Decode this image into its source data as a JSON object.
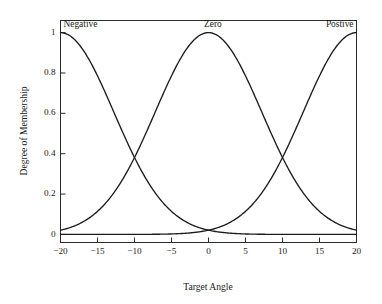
{
  "chart_data": {
    "type": "line",
    "title": "",
    "xlabel": "Target Angle",
    "ylabel": "Degree of Membership",
    "xlim": [
      -20,
      20
    ],
    "ylim": [
      -0.04,
      1.06
    ],
    "xticks": [
      -20,
      -15,
      -10,
      -5,
      0,
      5,
      10,
      15,
      20
    ],
    "xticklabels": [
      "−20",
      "−15",
      "−10",
      "−5",
      "0",
      "5",
      "10",
      "15",
      "20"
    ],
    "yticks": [
      0,
      0.2,
      0.4,
      0.6,
      0.8,
      1
    ],
    "yticklabels": [
      "0",
      "0.2",
      "0.4",
      "0.6",
      "0.8",
      "1"
    ],
    "grid": false,
    "legend_position": "inside-top",
    "line_color": "#1c1c1c",
    "frame_color": "#2b2b2b",
    "background_color": "#ffffff",
    "annotations": [
      {
        "text": "Negative",
        "x": -20,
        "y": 1.05,
        "align": "start"
      },
      {
        "text": "Zero",
        "x": 0.6,
        "y": 1.05,
        "align": "middle"
      },
      {
        "text": "Postive",
        "x": 20,
        "y": 1.05,
        "align": "end"
      }
    ],
    "series": [
      {
        "name": "Negative",
        "comment": "Gaussian membership centered at -20 with sigma 7.2; decreases left to right",
        "center": -20,
        "sigma": 7.2,
        "x": [
          -20,
          -19,
          -18,
          -17,
          -16,
          -15,
          -14,
          -13,
          -12,
          -11,
          -10,
          -9,
          -8,
          -7,
          -6,
          -5,
          -4,
          -3,
          -2,
          -1,
          0,
          1,
          2,
          3,
          4,
          5,
          6,
          7,
          8,
          9,
          10,
          11,
          12,
          13,
          14,
          15,
          16,
          17,
          18,
          19,
          20
        ],
        "values": [
          1.0,
          0.99,
          0.962,
          0.916,
          0.855,
          0.781,
          0.698,
          0.611,
          0.522,
          0.436,
          0.354,
          0.28,
          0.215,
          0.16,
          0.116,
          0.081,
          0.055,
          0.036,
          0.023,
          0.014,
          0.008,
          0.0045,
          0.0025,
          0.0013,
          0.0007,
          0.0003,
          0.0002,
          0.0001,
          0.0,
          0.0,
          0.0,
          0.0,
          0.0,
          0.0,
          0.0,
          0.0,
          0.0,
          0.0,
          0.0,
          0.0,
          0.0
        ]
      },
      {
        "name": "Zero",
        "comment": "Gaussian membership centered at 0 with sigma 7.2; peaks at 1.0",
        "center": 0,
        "sigma": 7.2,
        "x": [
          -20,
          -18,
          -16,
          -14,
          -12,
          -10,
          -8,
          -6,
          -4,
          -2,
          0,
          2,
          4,
          6,
          8,
          10,
          12,
          14,
          16,
          18,
          20
        ],
        "values": [
          0.021,
          0.044,
          0.084,
          0.149,
          0.243,
          0.377,
          0.54,
          0.707,
          0.856,
          0.963,
          1.0,
          0.963,
          0.856,
          0.707,
          0.54,
          0.377,
          0.243,
          0.149,
          0.084,
          0.044,
          0.021
        ]
      },
      {
        "name": "Postive",
        "comment": "Gaussian membership centered at 20 with sigma 7.2; increases left to right",
        "center": 20,
        "sigma": 7.2,
        "x": [
          -20,
          -19,
          -18,
          -17,
          -16,
          -15,
          -14,
          -13,
          -12,
          -11,
          -10,
          -9,
          -8,
          -7,
          -6,
          -5,
          -4,
          -3,
          -2,
          -1,
          0,
          1,
          2,
          3,
          4,
          5,
          6,
          7,
          8,
          9,
          10,
          11,
          12,
          13,
          14,
          15,
          16,
          17,
          18,
          19,
          20
        ],
        "values": [
          0.0,
          0.0,
          0.0,
          0.0,
          0.0,
          0.0,
          0.0,
          0.0,
          0.0,
          0.0,
          0.0,
          0.0,
          0.0001,
          0.0002,
          0.0003,
          0.0005,
          0.0007,
          0.0013,
          0.0025,
          0.0045,
          0.008,
          0.014,
          0.023,
          0.036,
          0.055,
          0.081,
          0.116,
          0.16,
          0.215,
          0.28,
          0.354,
          0.436,
          0.522,
          0.611,
          0.698,
          0.781,
          0.855,
          0.916,
          0.962,
          0.99,
          1.0
        ]
      }
    ],
    "crossings": [
      {
        "x": -10,
        "y": 0.5,
        "between": [
          "Negative",
          "Zero"
        ]
      },
      {
        "x": 10,
        "y": 0.5,
        "between": [
          "Zero",
          "Postive"
        ]
      },
      {
        "x": 0,
        "y": 0.06,
        "between": [
          "Negative",
          "Postive"
        ]
      }
    ]
  }
}
